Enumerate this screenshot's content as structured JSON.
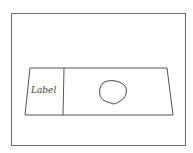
{
  "diagram": {
    "type": "hand-drawn sketch",
    "colors": {
      "background": "#ffffff",
      "stroke": "#555555"
    },
    "frame": {
      "x": 11,
      "y": 13,
      "width": 174,
      "height": 132
    },
    "slide": {
      "shape": "trapezoid",
      "points": [
        [
          30,
          68
        ],
        [
          167,
          68
        ],
        [
          173,
          115
        ],
        [
          25,
          115
        ]
      ],
      "divider_x": 63
    },
    "label_area": {
      "text": "Label"
    },
    "specimen": {
      "shape": "circle",
      "cx": 113,
      "cy": 92,
      "rx": 13,
      "ry": 11
    }
  }
}
